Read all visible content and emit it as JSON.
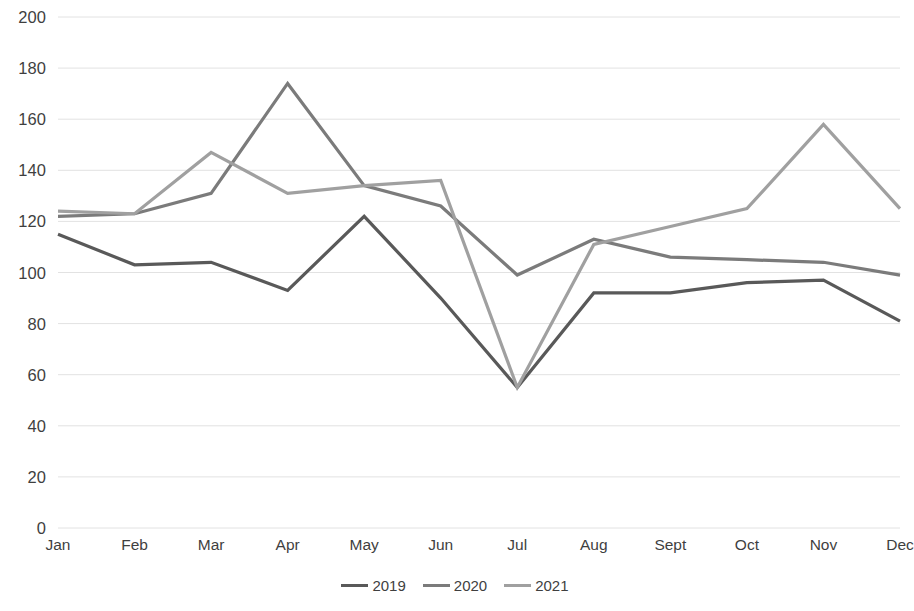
{
  "chart_data": {
    "type": "line",
    "title": "",
    "subtitle": "",
    "xlabel": "",
    "ylabel": "",
    "categories": [
      "Jan",
      "Feb",
      "Mar",
      "Apr",
      "May",
      "Jun",
      "Jul",
      "Aug",
      "Sept",
      "Oct",
      "Nov",
      "Dec"
    ],
    "ylim": [
      0,
      200
    ],
    "ytick_step": 20,
    "yticks": [
      "200",
      "180",
      "160",
      "140",
      "120",
      "100",
      "80",
      "60",
      "40",
      "20",
      "0"
    ],
    "ytick_values": [
      200,
      180,
      160,
      140,
      120,
      100,
      80,
      60,
      40,
      20,
      0
    ],
    "grid": true,
    "grid_axis": "y",
    "legend_position": "bottom",
    "series": [
      {
        "name": "2019",
        "color": "#595959",
        "values": [
          115,
          103,
          104,
          93,
          122,
          90,
          55,
          92,
          92,
          96,
          97,
          81
        ]
      },
      {
        "name": "2020",
        "color": "#7b7b7b",
        "values": [
          122,
          123,
          131,
          174,
          134,
          126,
          99,
          113,
          106,
          105,
          104,
          99
        ]
      },
      {
        "name": "2021",
        "color": "#a0a0a0",
        "values": [
          124,
          123,
          147,
          131,
          134,
          136,
          55,
          111,
          118,
          125,
          158,
          125
        ]
      }
    ]
  },
  "legend": {
    "items": [
      {
        "label": "2019"
      },
      {
        "label": "2020"
      },
      {
        "label": "2021"
      }
    ]
  },
  "colors": {
    "series_2019": "#595959",
    "series_2020": "#7b7b7b",
    "series_2021": "#a0a0a0",
    "gridline": "#e2e2e2",
    "tick_text": "#3f3f3f",
    "background": "#ffffff"
  }
}
